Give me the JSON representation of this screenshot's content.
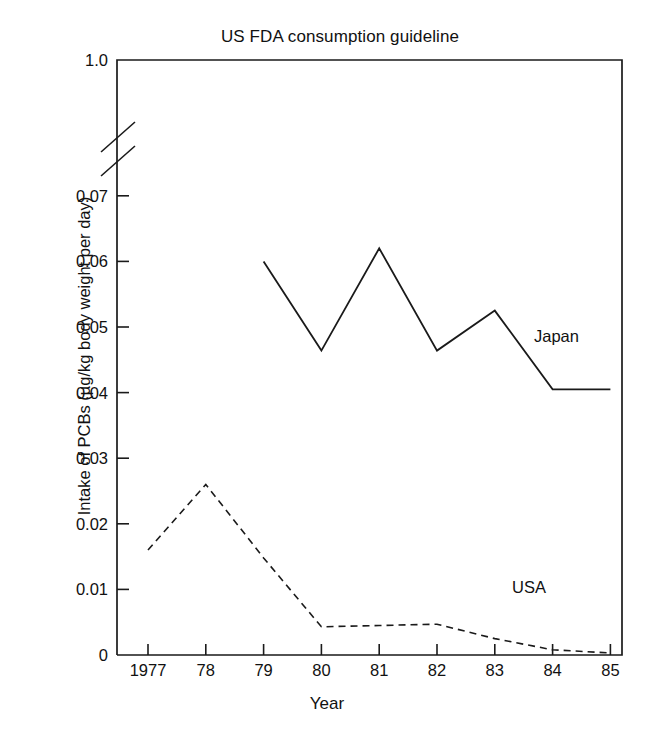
{
  "chart_data": {
    "type": "line",
    "title": "US FDA consumption guideline",
    "xlabel": "Year",
    "ylabel": "Intake of PCBs (µg/kg body weight per day)",
    "grid": false,
    "legend_position": "inline-right",
    "axis_break": true,
    "axis_break_note": "y-axis broken between 0.07 and 1.0",
    "x": [
      "1977",
      "78",
      "79",
      "80",
      "81",
      "82",
      "83",
      "84",
      "85"
    ],
    "xtick_labels": [
      "1977",
      "78",
      "79",
      "80",
      "81",
      "82",
      "83",
      "84",
      "85"
    ],
    "ytick_labels": [
      "1.0",
      "0.07",
      "0.06",
      "0.05",
      "0.04",
      "0.03",
      "0.02",
      "0.01",
      "0"
    ],
    "ytick_values": [
      1.0,
      0.07,
      0.06,
      0.05,
      0.04,
      0.03,
      0.02,
      0.01,
      0
    ],
    "ylim": [
      0,
      1.0
    ],
    "series": [
      {
        "name": "Japan",
        "style": "solid",
        "color": "#1a1a1a",
        "x": [
          "79",
          "80",
          "81",
          "82",
          "83",
          "84",
          "85"
        ],
        "values": [
          0.06,
          0.0464,
          0.062,
          0.0464,
          0.0525,
          0.0405,
          0.0405
        ]
      },
      {
        "name": "USA",
        "style": "dashed",
        "color": "#1a1a1a",
        "x": [
          "1977",
          "78",
          "79",
          "80",
          "81",
          "82",
          "83",
          "84",
          "85"
        ],
        "values": [
          0.016,
          0.026,
          0.0148,
          0.0043,
          0.0045,
          0.0047,
          0.0025,
          0.0008,
          0.0003
        ]
      }
    ],
    "guideline_line": {
      "label": "US FDA consumption guideline",
      "value": 1.0
    }
  }
}
